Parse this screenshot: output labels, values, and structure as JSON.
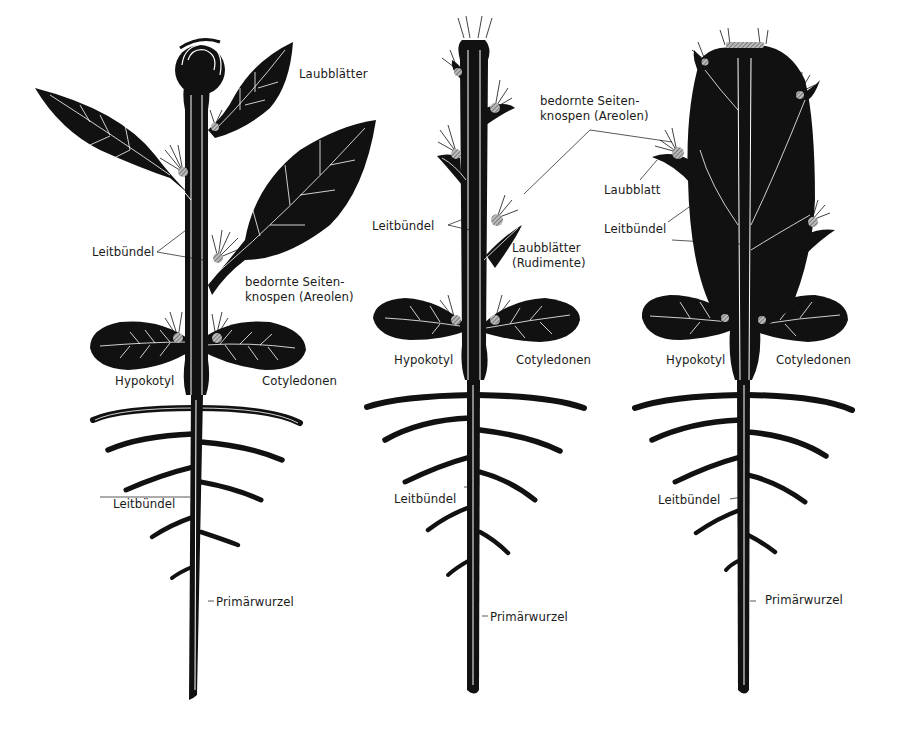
{
  "colors": {
    "ink": "#111111",
    "background": "#ffffff",
    "vein": "#ffffff",
    "areole": "#9a9a9a"
  },
  "figures": [
    {
      "id": "plant-1",
      "labels": {
        "laubblaetter": "Laubblätter",
        "leitbuendel_shoot": "Leitbündel",
        "areolen_line1": "bedornte Seiten-",
        "areolen_line2": "knospen (Areolen)",
        "hypokotyl": "Hypokotyl",
        "cotyledonen": "Cotyledonen",
        "leitbuendel_root": "Leitbündel",
        "primaerwurzel": "Primärwurzel"
      }
    },
    {
      "id": "plant-2",
      "labels": {
        "areolen_line1": "bedornte Seiten-",
        "areolen_line2": "knospen (Areolen)",
        "leitbuendel_shoot": "Leitbündel",
        "rudimente_line1": "Laubblätter",
        "rudimente_line2": "(Rudimente)",
        "hypokotyl": "Hypokotyl",
        "cotyledonen": "Cotyledonen",
        "leitbuendel_root": "Leitbündel",
        "primaerwurzel": "Primärwurzel"
      }
    },
    {
      "id": "plant-3",
      "labels": {
        "laubblatt": "Laubblatt",
        "leitbuendel_shoot": "Leitbündel",
        "hypokotyl": "Hypokotyl",
        "cotyledonen": "Cotyledonen",
        "leitbuendel_root": "Leitbündel",
        "primaerwurzel": "Primärwurzel"
      }
    }
  ]
}
